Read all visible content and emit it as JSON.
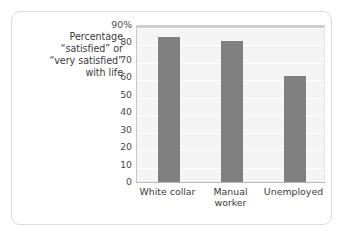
{
  "caption": {
    "lines": [
      "Percentage",
      "“satisfied” or",
      "“very satisfied”",
      "with life"
    ]
  },
  "colors": {
    "bar": "#808080",
    "plot_background": "#f4f4f4",
    "gridline": "#ffffff",
    "frame_border": "#dcdcdc",
    "text": "#3a3a3a"
  },
  "chart_data": {
    "type": "bar",
    "title": "",
    "xlabel": "",
    "ylabel": "Percentage “satisfied” or “very satisfied” with life",
    "categories": [
      "White collar",
      "Manual worker",
      "Unemployed"
    ],
    "category_lines": [
      [
        "White collar"
      ],
      [
        "Manual",
        "worker"
      ],
      [
        "Unemployed"
      ]
    ],
    "values": [
      83,
      81,
      61
    ],
    "ylim": [
      0,
      90
    ],
    "ytick_values": [
      90,
      80,
      70,
      60,
      50,
      40,
      30,
      20,
      10,
      0
    ],
    "ytick_labels": [
      "90%",
      "80",
      "70",
      "60",
      "50",
      "40",
      "30",
      "20",
      "10",
      "0"
    ],
    "grid": true,
    "legend": false,
    "bar_color": "#808080"
  }
}
